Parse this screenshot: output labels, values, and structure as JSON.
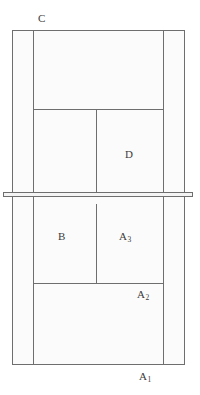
{
  "figure": {
    "background_color": "#ffffff",
    "fill_color": "#fbfbfb",
    "band_fill_color": "#f4f4f4",
    "line_color": "#6e6e6e",
    "label_color": "#3b3b3b",
    "canvas": {
      "width": 200,
      "height": 395
    }
  },
  "labels": {
    "c": "C",
    "d": "D",
    "b": "B",
    "a1_base": "A",
    "a1_sub": "1",
    "a2_base": "A",
    "a2_sub": "2",
    "a3_base": "A",
    "a3_sub": "3"
  },
  "regions": [
    {
      "id": "outer-frame",
      "label": "",
      "x": 12,
      "y": 30,
      "width": 173,
      "height": 335
    },
    {
      "id": "left-column",
      "label": "",
      "x": 12,
      "y": 30,
      "width": 21,
      "height": 335
    },
    {
      "id": "right-column",
      "label": "",
      "x": 163,
      "y": 30,
      "width": 22,
      "height": 335
    },
    {
      "id": "top-region-c",
      "label": "C",
      "x": 33,
      "y": 30,
      "width": 130,
      "height": 79
    },
    {
      "id": "region-d",
      "label": "D",
      "x": 96,
      "y": 109,
      "width": 67,
      "height": 83
    },
    {
      "id": "region-left-upper",
      "label": "",
      "x": 33,
      "y": 109,
      "width": 63,
      "height": 83
    },
    {
      "id": "region-b",
      "label": "B",
      "x": 33,
      "y": 204,
      "width": 63,
      "height": 79
    },
    {
      "id": "region-a3",
      "label": "A3",
      "x": 96,
      "y": 204,
      "width": 67,
      "height": 79
    },
    {
      "id": "region-a2",
      "label": "A2",
      "x": 33,
      "y": 283,
      "width": 130,
      "height": 82
    },
    {
      "id": "mid-band",
      "label": "",
      "x": 3,
      "y": 192,
      "width": 190,
      "height": 5
    }
  ],
  "label_positions": {
    "c": {
      "x": 38,
      "y": 13
    },
    "d": {
      "x": 125,
      "y": 149
    },
    "b": {
      "x": 58,
      "y": 231
    },
    "a3": {
      "x": 119,
      "y": 231
    },
    "a2": {
      "x": 137,
      "y": 289
    },
    "a1": {
      "x": 139,
      "y": 371
    }
  }
}
